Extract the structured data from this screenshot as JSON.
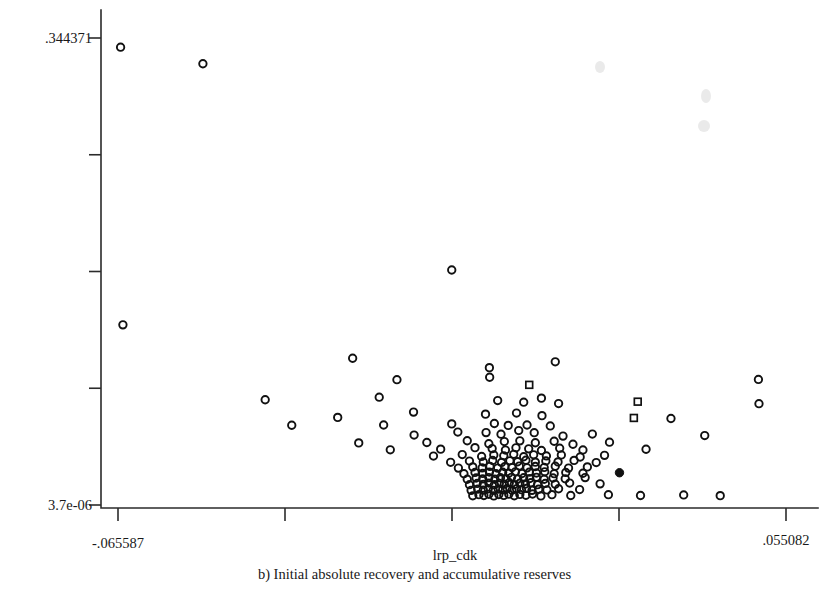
{
  "figure": {
    "background_color": "#ffffff",
    "ink_color": "#111111",
    "caption": "b) Initial absolute recovery and accumulative reserves"
  },
  "chart_data": {
    "type": "scatter",
    "title": "",
    "subtitle": "",
    "xlabel": "lrp_cdk",
    "ylabel": "",
    "xlim": [
      -0.065587,
      0.055082
    ],
    "ylim": [
      3.7e-06,
      0.344371
    ],
    "grid": false,
    "legend": null,
    "x_tick_labels": [
      "-.065587",
      "",
      "",
      "",
      ".055082"
    ],
    "y_tick_labels": [
      ".344371",
      "",
      "",
      "",
      "3.7e-06"
    ],
    "x_tick_values": [
      -0.065587,
      null,
      null,
      null,
      0.055082
    ],
    "y_tick_values": [
      0.344371,
      null,
      null,
      null,
      3.7e-06
    ],
    "marker_style": "open-circle",
    "n_points": 188,
    "annotations": [],
    "points": [
      {
        "x": -0.06512,
        "y": 0.3376,
        "m": "o"
      },
      {
        "x": -0.05025,
        "y": 0.3254,
        "m": "o"
      },
      {
        "x": -0.0647,
        "y": 0.13285,
        "m": "o"
      },
      {
        "x": -0.0053,
        "y": 0.1733,
        "m": "o"
      },
      {
        "x": -0.0232,
        "y": 0.1082,
        "m": "o"
      },
      {
        "x": 0.0015,
        "y": 0.1013,
        "m": "o"
      },
      {
        "x": 0.0134,
        "y": 0.1056,
        "m": "o"
      },
      {
        "x": 0.00155,
        "y": 0.0942,
        "m": "o"
      },
      {
        "x": -0.0152,
        "y": 0.0924,
        "m": "o"
      },
      {
        "x": 0.0501,
        "y": 0.0926,
        "m": "o"
      },
      {
        "x": 0.0087,
        "y": 0.0886,
        "m": "s"
      },
      {
        "x": -0.039,
        "y": 0.0776,
        "m": "o"
      },
      {
        "x": -0.0184,
        "y": 0.0795,
        "m": "o"
      },
      {
        "x": 0.003,
        "y": 0.077,
        "m": "o"
      },
      {
        "x": 0.0077,
        "y": 0.0758,
        "m": "o"
      },
      {
        "x": 0.0109,
        "y": 0.0788,
        "m": "o"
      },
      {
        "x": 0.014,
        "y": 0.0748,
        "m": "o"
      },
      {
        "x": 0.0283,
        "y": 0.0762,
        "m": "s"
      },
      {
        "x": 0.0502,
        "y": 0.0747,
        "m": "o"
      },
      {
        "x": -0.0259,
        "y": 0.0646,
        "m": "o"
      },
      {
        "x": -0.0122,
        "y": 0.0685,
        "m": "o"
      },
      {
        "x": 0.0008,
        "y": 0.067,
        "m": "o"
      },
      {
        "x": 0.0064,
        "y": 0.0678,
        "m": "o"
      },
      {
        "x": 0.011,
        "y": 0.0659,
        "m": "o"
      },
      {
        "x": 0.0276,
        "y": 0.0642,
        "m": "s"
      },
      {
        "x": 0.0343,
        "y": 0.0638,
        "m": "o"
      },
      {
        "x": -0.0342,
        "y": 0.0588,
        "m": "o"
      },
      {
        "x": -0.0176,
        "y": 0.059,
        "m": "o"
      },
      {
        "x": -0.0053,
        "y": 0.0598,
        "m": "o"
      },
      {
        "x": 0.0024,
        "y": 0.0601,
        "m": "o"
      },
      {
        "x": 0.0049,
        "y": 0.0587,
        "m": "o"
      },
      {
        "x": 0.0083,
        "y": 0.059,
        "m": "o"
      },
      {
        "x": 0.0125,
        "y": 0.0583,
        "m": "o"
      },
      {
        "x": -0.0121,
        "y": 0.0516,
        "m": "o"
      },
      {
        "x": -0.0042,
        "y": 0.0538,
        "m": "o"
      },
      {
        "x": 0.0009,
        "y": 0.0534,
        "m": "o"
      },
      {
        "x": 0.0036,
        "y": 0.0522,
        "m": "o"
      },
      {
        "x": 0.0068,
        "y": 0.0549,
        "m": "o"
      },
      {
        "x": 0.0096,
        "y": 0.0533,
        "m": "o"
      },
      {
        "x": 0.0148,
        "y": 0.0508,
        "m": "o"
      },
      {
        "x": 0.0201,
        "y": 0.0523,
        "m": "o"
      },
      {
        "x": 0.0404,
        "y": 0.0512,
        "m": "o"
      },
      {
        "x": -0.0221,
        "y": 0.0458,
        "m": "o"
      },
      {
        "x": -0.0098,
        "y": 0.0461,
        "m": "o"
      },
      {
        "x": -0.0025,
        "y": 0.0474,
        "m": "o"
      },
      {
        "x": 0.0014,
        "y": 0.0452,
        "m": "o"
      },
      {
        "x": 0.0042,
        "y": 0.0468,
        "m": "o"
      },
      {
        "x": 0.007,
        "y": 0.0473,
        "m": "o"
      },
      {
        "x": 0.0098,
        "y": 0.0459,
        "m": "o"
      },
      {
        "x": 0.0132,
        "y": 0.047,
        "m": "o"
      },
      {
        "x": 0.0166,
        "y": 0.0448,
        "m": "o"
      },
      {
        "x": 0.0232,
        "y": 0.0463,
        "m": "o"
      },
      {
        "x": -0.0164,
        "y": 0.0407,
        "m": "o"
      },
      {
        "x": -0.0073,
        "y": 0.0412,
        "m": "o"
      },
      {
        "x": -0.0011,
        "y": 0.0423,
        "m": "o"
      },
      {
        "x": 0.002,
        "y": 0.0416,
        "m": "o"
      },
      {
        "x": 0.0044,
        "y": 0.0405,
        "m": "o"
      },
      {
        "x": 0.0063,
        "y": 0.0422,
        "m": "o"
      },
      {
        "x": 0.0086,
        "y": 0.0414,
        "m": "o"
      },
      {
        "x": 0.0109,
        "y": 0.0402,
        "m": "o"
      },
      {
        "x": 0.0142,
        "y": 0.0419,
        "m": "o"
      },
      {
        "x": 0.0184,
        "y": 0.0406,
        "m": "o"
      },
      {
        "x": 0.0298,
        "y": 0.0411,
        "m": "o"
      },
      {
        "x": -0.0086,
        "y": 0.0361,
        "m": "o"
      },
      {
        "x": -0.0034,
        "y": 0.0372,
        "m": "o"
      },
      {
        "x": 0.0001,
        "y": 0.0358,
        "m": "o"
      },
      {
        "x": 0.0023,
        "y": 0.0369,
        "m": "o"
      },
      {
        "x": 0.0041,
        "y": 0.0363,
        "m": "o"
      },
      {
        "x": 0.0059,
        "y": 0.0374,
        "m": "o"
      },
      {
        "x": 0.0077,
        "y": 0.0356,
        "m": "o"
      },
      {
        "x": 0.0095,
        "y": 0.037,
        "m": "o"
      },
      {
        "x": 0.0118,
        "y": 0.0362,
        "m": "o"
      },
      {
        "x": 0.0145,
        "y": 0.0369,
        "m": "o"
      },
      {
        "x": 0.0179,
        "y": 0.0354,
        "m": "o"
      },
      {
        "x": 0.0223,
        "y": 0.0366,
        "m": "o"
      },
      {
        "x": -0.0055,
        "y": 0.0315,
        "m": "o"
      },
      {
        "x": -0.0021,
        "y": 0.0324,
        "m": "o"
      },
      {
        "x": 0.0004,
        "y": 0.0317,
        "m": "o"
      },
      {
        "x": 0.0021,
        "y": 0.0328,
        "m": "o"
      },
      {
        "x": 0.0037,
        "y": 0.0314,
        "m": "o"
      },
      {
        "x": 0.0052,
        "y": 0.0326,
        "m": "o"
      },
      {
        "x": 0.0066,
        "y": 0.0319,
        "m": "o"
      },
      {
        "x": 0.0081,
        "y": 0.033,
        "m": "o"
      },
      {
        "x": 0.0098,
        "y": 0.0316,
        "m": "o"
      },
      {
        "x": 0.0117,
        "y": 0.0325,
        "m": "o"
      },
      {
        "x": 0.0139,
        "y": 0.0318,
        "m": "o"
      },
      {
        "x": 0.0168,
        "y": 0.0329,
        "m": "o"
      },
      {
        "x": 0.0208,
        "y": 0.0313,
        "m": "o"
      },
      {
        "x": -0.0041,
        "y": 0.0272,
        "m": "o"
      },
      {
        "x": -0.0015,
        "y": 0.0281,
        "m": "o"
      },
      {
        "x": 0.0002,
        "y": 0.0274,
        "m": "o"
      },
      {
        "x": 0.0016,
        "y": 0.0285,
        "m": "o"
      },
      {
        "x": 0.003,
        "y": 0.0272,
        "m": "o"
      },
      {
        "x": 0.0043,
        "y": 0.0283,
        "m": "o"
      },
      {
        "x": 0.0056,
        "y": 0.0276,
        "m": "o"
      },
      {
        "x": 0.0069,
        "y": 0.0287,
        "m": "o"
      },
      {
        "x": 0.0083,
        "y": 0.0274,
        "m": "o"
      },
      {
        "x": 0.0098,
        "y": 0.0284,
        "m": "o"
      },
      {
        "x": 0.0114,
        "y": 0.0277,
        "m": "o"
      },
      {
        "x": 0.0134,
        "y": 0.0286,
        "m": "o"
      },
      {
        "x": 0.0158,
        "y": 0.0272,
        "m": "o"
      },
      {
        "x": 0.0192,
        "y": 0.0281,
        "m": "o"
      },
      {
        "x": -0.0031,
        "y": 0.0231,
        "m": "o"
      },
      {
        "x": -0.0011,
        "y": 0.024,
        "m": "o"
      },
      {
        "x": 0.0003,
        "y": 0.0233,
        "m": "o"
      },
      {
        "x": 0.0015,
        "y": 0.0243,
        "m": "o"
      },
      {
        "x": 0.0027,
        "y": 0.0231,
        "m": "o"
      },
      {
        "x": 0.0039,
        "y": 0.0242,
        "m": "o"
      },
      {
        "x": 0.005,
        "y": 0.0235,
        "m": "o"
      },
      {
        "x": 0.0062,
        "y": 0.0245,
        "m": "o"
      },
      {
        "x": 0.0074,
        "y": 0.0232,
        "m": "o"
      },
      {
        "x": 0.0087,
        "y": 0.0242,
        "m": "o"
      },
      {
        "x": 0.01,
        "y": 0.0236,
        "m": "o"
      },
      {
        "x": 0.0115,
        "y": 0.0245,
        "m": "o"
      },
      {
        "x": 0.0132,
        "y": 0.0231,
        "m": "o"
      },
      {
        "x": 0.0153,
        "y": 0.024,
        "m": "o"
      },
      {
        "x": 0.0184,
        "y": 0.0234,
        "m": "o"
      },
      {
        "x": 0.025,
        "y": 0.0238,
        "m": "f"
      },
      {
        "x": -0.0025,
        "y": 0.019,
        "m": "o"
      },
      {
        "x": -0.0009,
        "y": 0.0199,
        "m": "o"
      },
      {
        "x": 0.0003,
        "y": 0.0192,
        "m": "o"
      },
      {
        "x": 0.0014,
        "y": 0.0202,
        "m": "o"
      },
      {
        "x": 0.0025,
        "y": 0.019,
        "m": "o"
      },
      {
        "x": 0.0035,
        "y": 0.0201,
        "m": "o"
      },
      {
        "x": 0.0045,
        "y": 0.0194,
        "m": "o"
      },
      {
        "x": 0.0055,
        "y": 0.0204,
        "m": "o"
      },
      {
        "x": 0.0066,
        "y": 0.0191,
        "m": "o"
      },
      {
        "x": 0.0077,
        "y": 0.0201,
        "m": "o"
      },
      {
        "x": 0.0088,
        "y": 0.0195,
        "m": "o"
      },
      {
        "x": 0.01,
        "y": 0.0204,
        "m": "o"
      },
      {
        "x": 0.0114,
        "y": 0.019,
        "m": "o"
      },
      {
        "x": 0.013,
        "y": 0.0199,
        "m": "o"
      },
      {
        "x": 0.0152,
        "y": 0.0193,
        "m": "o"
      },
      {
        "x": 0.0188,
        "y": 0.0202,
        "m": "o"
      },
      {
        "x": -0.0021,
        "y": 0.015,
        "m": "o"
      },
      {
        "x": -0.0007,
        "y": 0.0159,
        "m": "o"
      },
      {
        "x": 0.0004,
        "y": 0.0152,
        "m": "o"
      },
      {
        "x": 0.0014,
        "y": 0.0162,
        "m": "o"
      },
      {
        "x": 0.0024,
        "y": 0.015,
        "m": "o"
      },
      {
        "x": 0.0033,
        "y": 0.016,
        "m": "o"
      },
      {
        "x": 0.0042,
        "y": 0.0154,
        "m": "o"
      },
      {
        "x": 0.0051,
        "y": 0.0164,
        "m": "o"
      },
      {
        "x": 0.006,
        "y": 0.0151,
        "m": "o"
      },
      {
        "x": 0.007,
        "y": 0.0161,
        "m": "o"
      },
      {
        "x": 0.008,
        "y": 0.0155,
        "m": "o"
      },
      {
        "x": 0.009,
        "y": 0.0164,
        "m": "o"
      },
      {
        "x": 0.0102,
        "y": 0.015,
        "m": "o"
      },
      {
        "x": 0.0116,
        "y": 0.0159,
        "m": "o"
      },
      {
        "x": 0.0134,
        "y": 0.0153,
        "m": "o"
      },
      {
        "x": 0.016,
        "y": 0.0162,
        "m": "o"
      },
      {
        "x": 0.0215,
        "y": 0.0156,
        "m": "o"
      },
      {
        "x": -0.0018,
        "y": 0.0108,
        "m": "o"
      },
      {
        "x": -0.0006,
        "y": 0.0117,
        "m": "o"
      },
      {
        "x": 0.0004,
        "y": 0.011,
        "m": "o"
      },
      {
        "x": 0.0013,
        "y": 0.012,
        "m": "o"
      },
      {
        "x": 0.0022,
        "y": 0.0108,
        "m": "o"
      },
      {
        "x": 0.0031,
        "y": 0.0118,
        "m": "o"
      },
      {
        "x": 0.0039,
        "y": 0.0112,
        "m": "o"
      },
      {
        "x": 0.0047,
        "y": 0.0122,
        "m": "o"
      },
      {
        "x": 0.0056,
        "y": 0.0109,
        "m": "o"
      },
      {
        "x": 0.0064,
        "y": 0.0119,
        "m": "o"
      },
      {
        "x": 0.0073,
        "y": 0.0113,
        "m": "o"
      },
      {
        "x": 0.0082,
        "y": 0.0122,
        "m": "o"
      },
      {
        "x": 0.0092,
        "y": 0.0108,
        "m": "o"
      },
      {
        "x": 0.0104,
        "y": 0.0117,
        "m": "o"
      },
      {
        "x": 0.0119,
        "y": 0.0111,
        "m": "o"
      },
      {
        "x": 0.014,
        "y": 0.012,
        "m": "o"
      },
      {
        "x": 0.0178,
        "y": 0.0114,
        "m": "o"
      },
      {
        "x": -0.0015,
        "y": 0.0068,
        "m": "o"
      },
      {
        "x": -0.0004,
        "y": 0.0076,
        "m": "o"
      },
      {
        "x": 0.0005,
        "y": 0.007,
        "m": "o"
      },
      {
        "x": 0.0014,
        "y": 0.0079,
        "m": "o"
      },
      {
        "x": 0.0023,
        "y": 0.0067,
        "m": "o"
      },
      {
        "x": 0.0032,
        "y": 0.0077,
        "m": "o"
      },
      {
        "x": 0.0041,
        "y": 0.0071,
        "m": "o"
      },
      {
        "x": 0.005,
        "y": 0.008,
        "m": "o"
      },
      {
        "x": 0.006,
        "y": 0.0068,
        "m": "o"
      },
      {
        "x": 0.007,
        "y": 0.0078,
        "m": "o"
      },
      {
        "x": 0.0081,
        "y": 0.0072,
        "m": "o"
      },
      {
        "x": 0.0093,
        "y": 0.0081,
        "m": "o"
      },
      {
        "x": 0.0108,
        "y": 0.0067,
        "m": "o"
      },
      {
        "x": 0.0128,
        "y": 0.0076,
        "m": "o"
      },
      {
        "x": 0.0162,
        "y": 0.007,
        "m": "o"
      },
      {
        "x": 0.023,
        "y": 0.0076,
        "m": "o"
      },
      {
        "x": 0.0288,
        "y": 0.007,
        "m": "o"
      },
      {
        "x": 0.0366,
        "y": 0.0074,
        "m": "o"
      },
      {
        "x": 0.0432,
        "y": 0.0069,
        "m": "o"
      }
    ]
  }
}
